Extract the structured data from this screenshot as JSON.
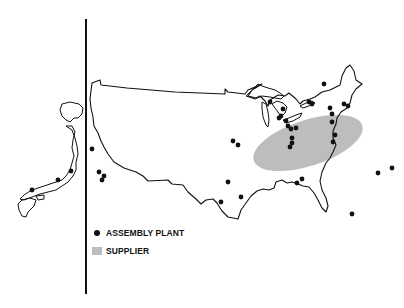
{
  "map": {
    "title": "",
    "regions": [
      "Japan",
      "United States"
    ],
    "colors": {
      "outline": "#111111",
      "plant": "#111111",
      "supplier": "#bdbdbd",
      "divider": "#111111"
    },
    "supplier_zone": {
      "cx": 308,
      "cy": 143,
      "rx": 57,
      "ry": 23,
      "rotate": -18
    },
    "assembly_plants_us": [
      [
        92,
        149
      ],
      [
        99,
        172
      ],
      [
        104,
        176
      ],
      [
        102,
        180
      ],
      [
        233,
        141
      ],
      [
        238,
        145
      ],
      [
        228,
        182
      ],
      [
        241,
        197
      ],
      [
        221,
        202
      ],
      [
        297,
        183
      ],
      [
        302,
        179
      ],
      [
        270,
        102
      ],
      [
        283,
        109
      ],
      [
        281,
        116
      ],
      [
        288,
        126
      ],
      [
        279,
        118
      ],
      [
        286,
        121
      ],
      [
        291,
        129
      ],
      [
        296,
        128
      ],
      [
        292,
        138
      ],
      [
        292,
        143
      ],
      [
        290,
        147
      ],
      [
        309,
        102
      ],
      [
        312,
        104
      ],
      [
        324,
        84
      ],
      [
        330,
        108
      ],
      [
        332,
        114
      ],
      [
        332,
        122
      ],
      [
        335,
        135
      ],
      [
        333,
        142
      ],
      [
        344,
        104
      ],
      [
        348,
        106
      ],
      [
        352,
        214
      ],
      [
        378,
        173
      ],
      [
        392,
        168
      ]
    ],
    "assembly_plants_japan": [
      [
        71,
        171
      ],
      [
        58,
        180
      ],
      [
        32,
        190
      ]
    ]
  },
  "legend": {
    "items": [
      {
        "symbol": "dot",
        "label": "ASSEMBLY PLANT"
      },
      {
        "symbol": "swatch",
        "label": "SUPPLIER"
      }
    ]
  }
}
